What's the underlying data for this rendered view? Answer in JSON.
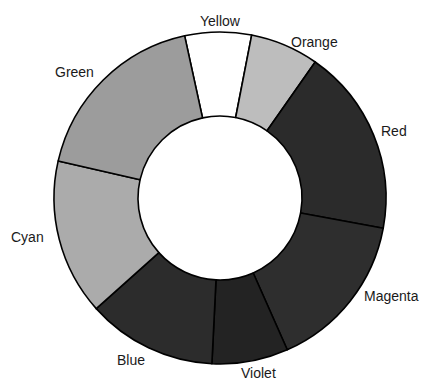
{
  "chart_data": {
    "type": "pie",
    "variant": "donut",
    "title": "",
    "center": [
      220,
      198
    ],
    "outer_radius": 166,
    "inner_radius": 82,
    "start_angle_deg": 347.7,
    "slices": [
      {
        "name": "Yellow",
        "degrees": 23.3,
        "percent": 6.5,
        "color": "#ffffff",
        "label_pos": [
          200,
          13
        ]
      },
      {
        "name": "Orange",
        "degrees": 24.0,
        "percent": 6.7,
        "color": "#bdbdbd",
        "label_pos": [
          291,
          34
        ]
      },
      {
        "name": "Red",
        "degrees": 65.5,
        "percent": 18.2,
        "color": "#2b2b2b",
        "label_pos": [
          381,
          123
        ]
      },
      {
        "name": "Magenta",
        "degrees": 55.6,
        "percent": 15.4,
        "color": "#2e2e2e",
        "label_pos": [
          364,
          288
        ]
      },
      {
        "name": "Violet",
        "degrees": 26.7,
        "percent": 7.4,
        "color": "#232323",
        "label_pos": [
          241,
          365
        ]
      },
      {
        "name": "Blue",
        "degrees": 45.4,
        "percent": 12.6,
        "color": "#2c2c2c",
        "label_pos": [
          117,
          352
        ]
      },
      {
        "name": "Cyan",
        "degrees": 54.7,
        "percent": 15.2,
        "color": "#ababab",
        "label_pos": [
          11,
          229
        ]
      },
      {
        "name": "Green",
        "degrees": 64.8,
        "percent": 18.0,
        "color": "#9c9c9c",
        "label_pos": [
          55,
          64
        ]
      }
    ],
    "legend": "none (direct labels)"
  }
}
